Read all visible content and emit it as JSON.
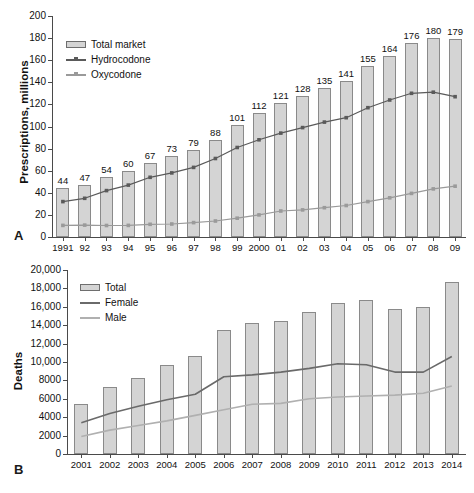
{
  "figure": {
    "panels": [
      {
        "letter": "A",
        "ylabel": "Prescriptions, millions",
        "legend": [
          {
            "label": "Total market",
            "kind": "bar",
            "color": "#d4d4d4"
          },
          {
            "label": "Hydrocodone",
            "kind": "line-marker",
            "color": "#5a5a5a"
          },
          {
            "label": "Oxycodone",
            "kind": "line-marker",
            "color": "#9a9a9a"
          }
        ]
      },
      {
        "letter": "B",
        "ylabel": "Deaths",
        "legend": [
          {
            "label": "Total",
            "kind": "bar",
            "color": "#d4d4d4"
          },
          {
            "label": "Female",
            "kind": "line",
            "color": "#6a6a6a"
          },
          {
            "label": "Male",
            "kind": "line",
            "color": "#b0b0b0"
          }
        ]
      }
    ]
  },
  "chart_data": [
    {
      "type": "bar",
      "panel": "A",
      "title": "",
      "xlabel": "",
      "ylabel": "Prescriptions, millions",
      "ylim": [
        0,
        200
      ],
      "yticks": [
        0,
        20,
        40,
        60,
        80,
        100,
        120,
        140,
        160,
        180,
        200
      ],
      "ytick_labels": [
        "0",
        "20",
        "40",
        "60",
        "80",
        "100",
        "120",
        "140",
        "160",
        "180",
        "200"
      ],
      "grid": false,
      "legend_position": "top-left",
      "categories": [
        "1991",
        "92",
        "93",
        "94",
        "95",
        "96",
        "97",
        "98",
        "99",
        "2000",
        "01",
        "02",
        "03",
        "04",
        "05",
        "06",
        "07",
        "08",
        "09"
      ],
      "values": [
        44,
        47,
        54,
        60,
        67,
        73,
        79,
        88,
        101,
        112,
        121,
        128,
        135,
        141,
        155,
        164,
        176,
        180,
        179
      ],
      "data_labels": [
        "44",
        "47",
        "54",
        "60",
        "67",
        "73",
        "79",
        "88",
        "101",
        "112",
        "121",
        "128",
        "135",
        "141",
        "155",
        "164",
        "176",
        "180",
        "179"
      ],
      "series": [
        {
          "name": "Total market",
          "type": "bar",
          "values": [
            44,
            47,
            54,
            60,
            67,
            73,
            79,
            88,
            101,
            112,
            121,
            128,
            135,
            141,
            155,
            164,
            176,
            180,
            179
          ]
        },
        {
          "name": "Hydrocodone",
          "type": "line",
          "values": [
            32,
            35,
            42,
            47,
            54,
            58,
            63,
            71,
            81,
            88,
            94,
            99,
            104,
            108,
            117,
            124,
            130,
            131,
            127
          ]
        },
        {
          "name": "Oxycodone",
          "type": "line",
          "values": [
            10.5,
            10.8,
            10.4,
            10.5,
            11.5,
            11.8,
            13,
            14.5,
            17,
            20,
            23.5,
            24.5,
            26.5,
            28.5,
            32,
            35.5,
            39.5,
            43.5,
            46
          ]
        }
      ]
    },
    {
      "type": "bar",
      "panel": "B",
      "title": "",
      "xlabel": "",
      "ylabel": "Deaths",
      "ylim": [
        0,
        20000
      ],
      "yticks": [
        0,
        2000,
        4000,
        6000,
        8000,
        10000,
        12000,
        14000,
        16000,
        18000,
        20000
      ],
      "ytick_labels": [
        "0",
        "2000",
        "4000",
        "6000",
        "8000",
        "10,000",
        "12,000",
        "14,000",
        "16,000",
        "18,000",
        "20,000"
      ],
      "grid": false,
      "legend_position": "top-left",
      "categories": [
        "2001",
        "2002",
        "2003",
        "2004",
        "2005",
        "2006",
        "2007",
        "2008",
        "2009",
        "2010",
        "2011",
        "2012",
        "2013",
        "2014"
      ],
      "values": [
        5400,
        7300,
        8300,
        9700,
        10700,
        13500,
        14200,
        14500,
        15400,
        16400,
        16700,
        15800,
        16000,
        18700
      ],
      "series": [
        {
          "name": "Total",
          "type": "bar",
          "values": [
            5400,
            7300,
            8300,
            9700,
            10700,
            13500,
            14200,
            14500,
            15400,
            16400,
            16700,
            15800,
            16000,
            18700
          ]
        },
        {
          "name": "Female",
          "type": "line",
          "values": [
            3400,
            4400,
            5200,
            5900,
            6500,
            8400,
            8600,
            8900,
            9300,
            9800,
            9700,
            8900,
            8900,
            10600
          ]
        },
        {
          "name": "Male",
          "type": "line",
          "values": [
            1900,
            2600,
            3100,
            3600,
            4200,
            4800,
            5400,
            5500,
            6000,
            6200,
            6300,
            6400,
            6600,
            7400
          ]
        }
      ]
    }
  ]
}
